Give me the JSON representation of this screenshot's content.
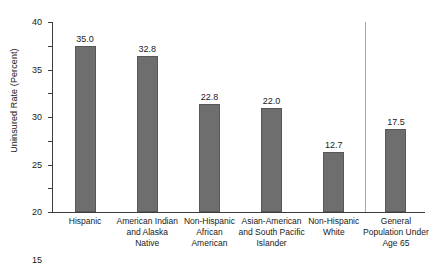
{
  "chart_data": {
    "type": "bar",
    "title": "",
    "subtitle": "",
    "xlabel": "",
    "ylabel": "Uninsured Rate (Percent)",
    "ylim": [
      0,
      40
    ],
    "ytick_step": 5,
    "yticks": [
      "0",
      "5",
      "10",
      "15",
      "20",
      "25",
      "30",
      "35",
      "40"
    ],
    "grid": false,
    "legend": null,
    "value_label_format": "one-decimal",
    "separator_after_index": 4,
    "categories": [
      "Hispanic",
      "American Indian and Alaska Native",
      "Non-Hispanic African American",
      "Asian-American and South Pacific Islander",
      "Non-Hispanic White",
      "General Population Under Age 65"
    ],
    "category_lines": [
      [
        "Hispanic"
      ],
      [
        "American Indian",
        "and Alaska",
        "Native"
      ],
      [
        "Non-Hispanic",
        "African",
        "American"
      ],
      [
        "Asian-American",
        "and South Pacific",
        "Islander"
      ],
      [
        "Non-Hispanic",
        "White"
      ],
      [
        "General",
        "Population Under",
        "Age 65"
      ]
    ],
    "values": [
      35.0,
      32.8,
      22.8,
      22.0,
      12.7,
      17.5
    ],
    "value_labels": [
      "35.0",
      "32.8",
      "22.8",
      "22.0",
      "12.7",
      "17.5"
    ]
  },
  "style": {
    "bar_fill": "#6e6e6e",
    "bar_border": "#585858",
    "axis_color": "#3d3d3d",
    "separator_color": "#a8a8a8",
    "text_color": "#1a1a1a",
    "background": "#ffffff"
  }
}
